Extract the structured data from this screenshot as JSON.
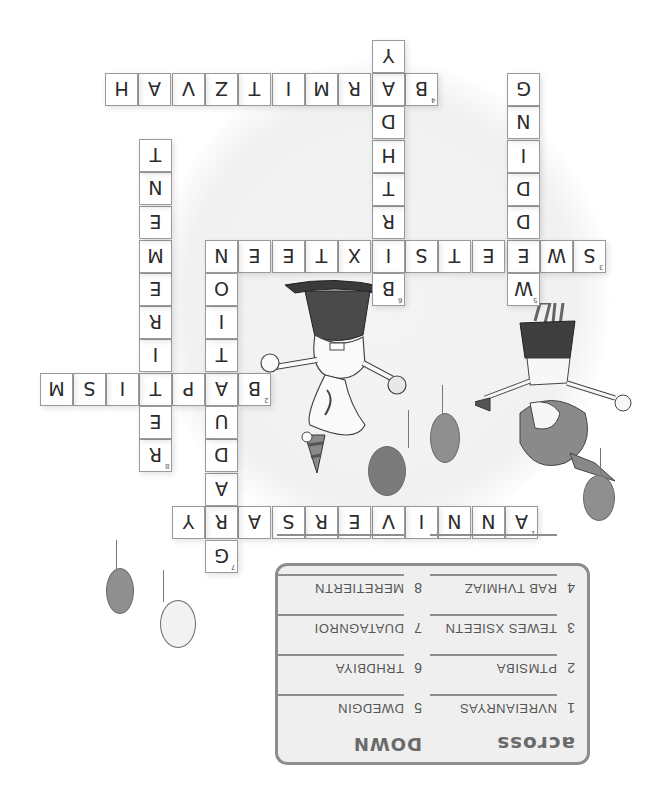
{
  "puzzle": {
    "orientation": "rotated-180",
    "cell_size": 33,
    "words": [
      {
        "id": "across-1",
        "number": "1",
        "direction": "across",
        "answer": "ANNIVERSARY",
        "row_top": 506,
        "cells": [
          {
            "x": 505,
            "letter": "A",
            "number": "1"
          },
          {
            "x": 472,
            "letter": "N"
          },
          {
            "x": 438,
            "letter": "N"
          },
          {
            "x": 405,
            "letter": "I"
          },
          {
            "x": 372,
            "letter": "V"
          },
          {
            "x": 338,
            "letter": "E"
          },
          {
            "x": 305,
            "letter": "R"
          },
          {
            "x": 272,
            "letter": "S"
          },
          {
            "x": 238,
            "letter": "A"
          },
          {
            "x": 205,
            "letter": "R"
          },
          {
            "x": 172,
            "letter": "Y"
          }
        ]
      },
      {
        "id": "across-2",
        "number": "2",
        "direction": "across",
        "answer": "BAPTISM",
        "row_top": 373,
        "cells": [
          {
            "x": 238,
            "letter": "B",
            "number": "2"
          },
          {
            "x": 205,
            "letter": "A"
          },
          {
            "x": 172,
            "letter": "P"
          },
          {
            "x": 139,
            "letter": "T"
          },
          {
            "x": 106,
            "letter": "I"
          },
          {
            "x": 73,
            "letter": "S"
          },
          {
            "x": 40,
            "letter": "M"
          }
        ]
      },
      {
        "id": "across-3",
        "number": "3",
        "direction": "across",
        "answer": "SWEET SIXTEEN",
        "row_top": 240,
        "cells": [
          {
            "x": 573,
            "letter": "S",
            "number": "3"
          },
          {
            "x": 540,
            "letter": "W"
          },
          {
            "x": 507,
            "letter": "E"
          },
          {
            "x": 472,
            "letter": "E"
          },
          {
            "x": 438,
            "letter": "T"
          },
          {
            "x": 405,
            "letter": "S"
          },
          {
            "x": 372,
            "letter": "I"
          },
          {
            "x": 338,
            "letter": "X"
          },
          {
            "x": 305,
            "letter": "T"
          },
          {
            "x": 272,
            "letter": "E"
          },
          {
            "x": 238,
            "letter": "E"
          },
          {
            "x": 205,
            "letter": "N"
          }
        ]
      },
      {
        "id": "across-4",
        "number": "4",
        "direction": "across",
        "answer": "BAR MITZVAH",
        "row_top": 73,
        "cells": [
          {
            "x": 405,
            "letter": "B",
            "number": "4"
          },
          {
            "x": 372,
            "letter": "A"
          },
          {
            "x": 338,
            "letter": "R"
          },
          {
            "x": 305,
            "letter": "M"
          },
          {
            "x": 272,
            "letter": "I"
          },
          {
            "x": 238,
            "letter": "T"
          },
          {
            "x": 205,
            "letter": "Z"
          },
          {
            "x": 172,
            "letter": "V"
          },
          {
            "x": 138,
            "letter": "A"
          },
          {
            "x": 105,
            "letter": "H"
          }
        ]
      },
      {
        "id": "down-5",
        "number": "5",
        "direction": "down",
        "answer": "WEDDING",
        "col_left": 507,
        "cells": [
          {
            "y": 273,
            "letter": "W",
            "number": "5"
          },
          {
            "y": 240,
            "letter": "E"
          },
          {
            "y": 206,
            "letter": "D"
          },
          {
            "y": 173,
            "letter": "D"
          },
          {
            "y": 140,
            "letter": "I"
          },
          {
            "y": 106,
            "letter": "N"
          },
          {
            "y": 73,
            "letter": "G"
          }
        ]
      },
      {
        "id": "down-6",
        "number": "6",
        "direction": "down",
        "answer": "BIRTHDAY",
        "col_left": 372,
        "cells": [
          {
            "y": 273,
            "letter": "B",
            "number": "6"
          },
          {
            "y": 240,
            "letter": "I"
          },
          {
            "y": 206,
            "letter": "R"
          },
          {
            "y": 173,
            "letter": "T"
          },
          {
            "y": 140,
            "letter": "H"
          },
          {
            "y": 106,
            "letter": "D"
          },
          {
            "y": 73,
            "letter": "A"
          },
          {
            "y": 40,
            "letter": "Y"
          }
        ]
      },
      {
        "id": "down-7",
        "number": "7",
        "direction": "down",
        "answer": "GRADUATION",
        "col_left": 205,
        "cells": [
          {
            "y": 540,
            "letter": "G",
            "number": "7"
          },
          {
            "y": 506,
            "letter": "R"
          },
          {
            "y": 473,
            "letter": "A"
          },
          {
            "y": 439,
            "letter": "D"
          },
          {
            "y": 406,
            "letter": "U"
          },
          {
            "y": 373,
            "letter": "A"
          },
          {
            "y": 339,
            "letter": "T"
          },
          {
            "y": 306,
            "letter": "I"
          },
          {
            "y": 273,
            "letter": "O"
          },
          {
            "y": 240,
            "letter": "N"
          }
        ]
      },
      {
        "id": "down-8",
        "number": "8",
        "direction": "down",
        "answer": "RETIREMENT",
        "col_left": 139,
        "cells": [
          {
            "y": 439,
            "letter": "R",
            "number": "8"
          },
          {
            "y": 406,
            "letter": "E"
          },
          {
            "y": 373,
            "letter": "T"
          },
          {
            "y": 339,
            "letter": "I"
          },
          {
            "y": 306,
            "letter": "R"
          },
          {
            "y": 273,
            "letter": "E"
          },
          {
            "y": 240,
            "letter": "M"
          },
          {
            "y": 206,
            "letter": "E"
          },
          {
            "y": 172,
            "letter": "N"
          },
          {
            "y": 139,
            "letter": "T"
          }
        ]
      }
    ]
  },
  "clues": {
    "across_title": "ACROSS",
    "down_title": "DOWN",
    "across": [
      {
        "number": "1",
        "text": "NVREIANRYAS"
      },
      {
        "number": "2",
        "text": "PTMSIBA"
      },
      {
        "number": "3",
        "text": "TEWES XSIEETN"
      },
      {
        "number": "4",
        "text": "RAB TVHMIAZ"
      },
      {
        "number": "",
        "text": ""
      }
    ],
    "down": [
      {
        "number": "5",
        "text": "DWEDGIN"
      },
      {
        "number": "6",
        "text": "TRHDBIYA"
      },
      {
        "number": "7",
        "text": "DUATAGNROI"
      },
      {
        "number": "8",
        "text": "MERETIERTN"
      },
      {
        "number": "",
        "text": ""
      }
    ]
  },
  "colors": {
    "cell_border": "#9a9a9a",
    "letter": "#2b2b2b",
    "clue_box_border": "#8d8d8d",
    "clue_box_bg": "#efefef",
    "balloon_dark": "#7b7b7b",
    "balloon_light": "#f2f2f2"
  }
}
